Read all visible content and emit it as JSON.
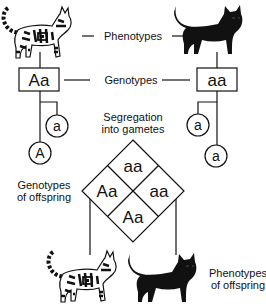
{
  "diagram": {
    "labels": {
      "phenotypes": "Phenotypes",
      "genotypes": "Genotypes",
      "segregation_line1": "Segregation",
      "segregation_line2": "into gametes",
      "offspring_genotypes_line1": "Genotypes",
      "offspring_genotypes_line2": "of offspring",
      "offspring_phenotypes_line1": "Phenotypes",
      "offspring_phenotypes_line2": "of offspring"
    },
    "parents": [
      {
        "phenotype": "tabby-cat-icon",
        "genotype": "Aa",
        "gametes": [
          "a",
          "A"
        ]
      },
      {
        "phenotype": "black-cat-icon",
        "genotype": "aa",
        "gametes": [
          "a",
          "a"
        ]
      }
    ],
    "punnett": {
      "top": "aa",
      "left": "Aa",
      "right": "aa",
      "bottom": "Aa"
    },
    "offspring": [
      {
        "phenotype": "tabby-cat-icon"
      },
      {
        "phenotype": "black-cat-icon"
      }
    ],
    "colors": {
      "ink": "#111111",
      "background": "#ffffff"
    }
  }
}
